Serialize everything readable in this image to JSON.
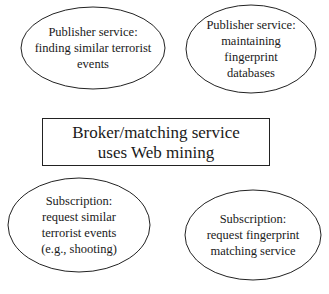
{
  "diagram": {
    "nodes": [
      {
        "id": "publisher-similar-events",
        "shape": "ellipse",
        "lines": [
          "Publisher service:",
          "finding similar terrorist",
          "events"
        ]
      },
      {
        "id": "publisher-fingerprint-db",
        "shape": "ellipse",
        "lines": [
          "Publisher service:",
          "maintaining",
          "fingerprint",
          "databases"
        ]
      },
      {
        "id": "broker",
        "shape": "rectangle",
        "lines": [
          "Broker/matching service",
          "uses Web mining"
        ]
      },
      {
        "id": "subscription-similar-events",
        "shape": "ellipse",
        "lines": [
          "Subscription:",
          "request similar",
          "terrorist events",
          "(e.g., shooting)"
        ]
      },
      {
        "id": "subscription-fingerprint",
        "shape": "ellipse",
        "lines": [
          "Subscription:",
          "request fingerprint",
          "matching service"
        ]
      }
    ],
    "colors": {
      "stroke": "#222222",
      "text": "#1a1a1a",
      "background": "#ffffff"
    }
  }
}
